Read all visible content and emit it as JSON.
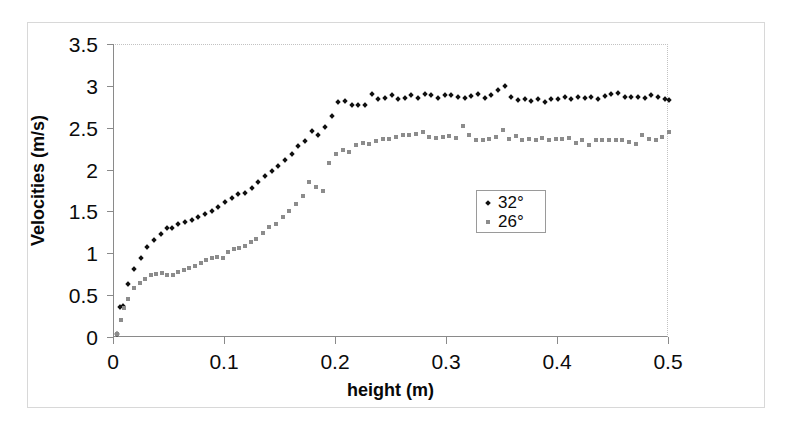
{
  "chart_data": {
    "type": "scatter",
    "title": "",
    "xlabel": "height (m)",
    "ylabel": "Velocities (m/s)",
    "xlim": [
      0,
      0.5
    ],
    "ylim": [
      0,
      3.5
    ],
    "xticks": [
      "0",
      "0.1",
      "0.2",
      "0.3",
      "0.4",
      "0.5"
    ],
    "xtick_values": [
      0,
      0.1,
      0.2,
      0.3,
      0.4,
      0.5
    ],
    "yticks": [
      "0",
      "0.5",
      "1",
      "1.5",
      "2",
      "2.5",
      "3",
      "3.5"
    ],
    "ytick_values": [
      0,
      0.5,
      1,
      1.5,
      2,
      2.5,
      3,
      3.5
    ],
    "grid": false,
    "legend_position": "center-right",
    "series": [
      {
        "name": "32°",
        "marker": "diamond",
        "color": "#101010",
        "x": [
          0.003,
          0.005,
          0.008,
          0.013,
          0.018,
          0.024,
          0.03,
          0.036,
          0.042,
          0.048,
          0.052,
          0.058,
          0.064,
          0.07,
          0.076,
          0.082,
          0.088,
          0.094,
          0.1,
          0.106,
          0.112,
          0.118,
          0.124,
          0.13,
          0.136,
          0.142,
          0.148,
          0.154,
          0.16,
          0.166,
          0.172,
          0.178,
          0.184,
          0.19,
          0.196,
          0.202,
          0.208,
          0.214,
          0.22,
          0.226,
          0.232,
          0.238,
          0.244,
          0.25,
          0.256,
          0.262,
          0.268,
          0.274,
          0.28,
          0.286,
          0.292,
          0.298,
          0.304,
          0.31,
          0.316,
          0.322,
          0.328,
          0.334,
          0.34,
          0.346,
          0.352,
          0.358,
          0.364,
          0.37,
          0.376,
          0.382,
          0.388,
          0.394,
          0.4,
          0.406,
          0.412,
          0.418,
          0.424,
          0.43,
          0.436,
          0.442,
          0.448,
          0.454,
          0.46,
          0.466,
          0.472,
          0.478,
          0.484,
          0.49,
          0.496,
          0.5
        ],
        "y": [
          0.05,
          0.37,
          0.38,
          0.65,
          0.83,
          0.96,
          1.09,
          1.17,
          1.24,
          1.31,
          1.31,
          1.36,
          1.39,
          1.41,
          1.44,
          1.48,
          1.52,
          1.57,
          1.62,
          1.67,
          1.72,
          1.73,
          1.79,
          1.86,
          1.93,
          1.99,
          2.06,
          2.13,
          2.2,
          2.29,
          2.35,
          2.47,
          2.43,
          2.52,
          2.65,
          2.82,
          2.83,
          2.78,
          2.78,
          2.78,
          2.91,
          2.85,
          2.87,
          2.9,
          2.86,
          2.87,
          2.9,
          2.87,
          2.92,
          2.9,
          2.87,
          2.9,
          2.9,
          2.88,
          2.87,
          2.89,
          2.91,
          2.87,
          2.9,
          2.96,
          3.01,
          2.88,
          2.84,
          2.85,
          2.83,
          2.85,
          2.82,
          2.85,
          2.86,
          2.88,
          2.86,
          2.88,
          2.87,
          2.88,
          2.86,
          2.89,
          2.91,
          2.93,
          2.88,
          2.88,
          2.88,
          2.87,
          2.9,
          2.88,
          2.86,
          2.84
        ]
      },
      {
        "name": "26°",
        "marker": "square",
        "color": "#8c8c8c",
        "x": [
          0.003,
          0.006,
          0.009,
          0.013,
          0.018,
          0.023,
          0.028,
          0.033,
          0.038,
          0.043,
          0.048,
          0.053,
          0.058,
          0.063,
          0.068,
          0.073,
          0.078,
          0.083,
          0.088,
          0.093,
          0.098,
          0.103,
          0.108,
          0.113,
          0.118,
          0.123,
          0.128,
          0.134,
          0.14,
          0.146,
          0.152,
          0.158,
          0.164,
          0.17,
          0.176,
          0.182,
          0.188,
          0.194,
          0.2,
          0.206,
          0.212,
          0.218,
          0.224,
          0.23,
          0.236,
          0.242,
          0.248,
          0.254,
          0.26,
          0.266,
          0.272,
          0.278,
          0.284,
          0.29,
          0.296,
          0.302,
          0.308,
          0.314,
          0.32,
          0.326,
          0.332,
          0.338,
          0.344,
          0.35,
          0.356,
          0.362,
          0.368,
          0.374,
          0.38,
          0.386,
          0.392,
          0.398,
          0.404,
          0.41,
          0.416,
          0.422,
          0.428,
          0.434,
          0.44,
          0.446,
          0.452,
          0.458,
          0.464,
          0.47,
          0.476,
          0.482,
          0.488,
          0.494,
          0.5
        ],
        "y": [
          0.05,
          0.22,
          0.36,
          0.46,
          0.6,
          0.66,
          0.71,
          0.75,
          0.77,
          0.78,
          0.75,
          0.75,
          0.79,
          0.81,
          0.84,
          0.86,
          0.89,
          0.93,
          0.96,
          0.97,
          0.95,
          1.03,
          1.06,
          1.08,
          1.1,
          1.15,
          1.18,
          1.25,
          1.33,
          1.36,
          1.44,
          1.52,
          1.6,
          1.7,
          1.86,
          1.8,
          1.76,
          2.09,
          2.2,
          2.24,
          2.22,
          2.3,
          2.33,
          2.32,
          2.35,
          2.38,
          2.38,
          2.4,
          2.42,
          2.43,
          2.44,
          2.46,
          2.4,
          2.39,
          2.4,
          2.41,
          2.39,
          2.53,
          2.43,
          2.37,
          2.36,
          2.38,
          2.4,
          2.48,
          2.38,
          2.41,
          2.37,
          2.38,
          2.37,
          2.39,
          2.37,
          2.38,
          2.38,
          2.39,
          2.33,
          2.36,
          2.31,
          2.36,
          2.37,
          2.37,
          2.36,
          2.37,
          2.34,
          2.32,
          2.43,
          2.38,
          2.36,
          2.4,
          2.46
        ]
      }
    ]
  },
  "legend": {
    "items": [
      {
        "label": "32°",
        "marker": "diamond"
      },
      {
        "label": "26°",
        "marker": "square"
      }
    ]
  },
  "axes": {
    "x_title": "height (m)",
    "y_title": "Velocities (m/s)"
  }
}
